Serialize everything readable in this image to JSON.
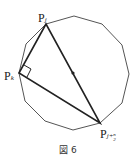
{
  "figure": {
    "caption": "図 6",
    "polygon": {
      "vertices": [
        [
          46,
          24
        ],
        [
          74,
          16
        ],
        [
          102,
          24
        ],
        [
          122,
          45
        ],
        [
          129,
          74
        ],
        [
          122,
          103
        ],
        [
          100,
          123
        ],
        [
          73,
          130
        ],
        [
          45,
          121
        ],
        [
          25,
          101
        ],
        [
          19,
          73
        ],
        [
          26,
          44
        ]
      ],
      "stroke": "#555555"
    },
    "center": [
      73,
      73
    ],
    "triangle": {
      "Pj": [
        46,
        24
      ],
      "Pk": [
        19,
        73
      ],
      "Pjn2": [
        100,
        123
      ],
      "stroke": "#222222"
    },
    "labels": {
      "pj": {
        "main": "P",
        "sub": "j"
      },
      "pk": {
        "main": "P",
        "sub": "k"
      },
      "pjn2": {
        "main": "P",
        "sub": "j+",
        "frac_num": "n",
        "frac_den": "2"
      }
    }
  }
}
